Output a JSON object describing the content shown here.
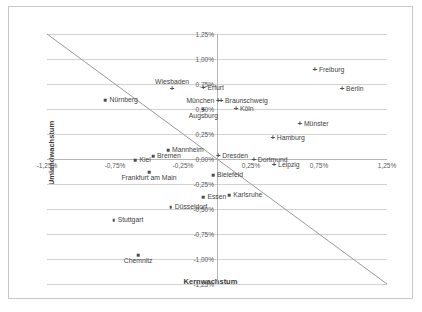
{
  "chart_data": {
    "type": "scatter",
    "title": "",
    "xlabel": "Kernwachstum",
    "ylabel": "Umlandwachstum",
    "xlim": [
      -1.25,
      1.25
    ],
    "ylim": [
      -1.25,
      1.25
    ],
    "grid": true,
    "legend": "none",
    "xticks": [
      "-1,25%",
      "-0,75%",
      "-0,25%",
      "0,25%",
      "0,75%",
      "1,25%"
    ],
    "xtick_values": [
      -1.25,
      -0.75,
      -0.25,
      0.25,
      0.75,
      1.25
    ],
    "yticks": [
      "-1,25%",
      "-1,00%",
      "-0,75%",
      "-0,50%",
      "-0,25%",
      "0,00%",
      "0,25%",
      "0,50%",
      "0,75%",
      "1,00%",
      "1,25%"
    ],
    "ytick_values": [
      -1.25,
      -1.0,
      -0.75,
      -0.5,
      -0.25,
      0.0,
      0.25,
      0.5,
      0.75,
      1.0,
      1.25
    ],
    "reference_line": {
      "name": "diagonal",
      "from": [
        -1.25,
        1.25
      ],
      "to": [
        1.25,
        -1.25
      ],
      "color": "#9a9a9a"
    },
    "points": [
      {
        "label": "Freiburg",
        "x": 0.72,
        "y": 0.89,
        "marker": "cross",
        "label_pos": "r"
      },
      {
        "label": "Berlin",
        "x": 0.92,
        "y": 0.7,
        "marker": "cross",
        "label_pos": "r"
      },
      {
        "label": "Wiesbaden",
        "x": -0.33,
        "y": 0.7,
        "marker": "cross",
        "label_pos": "above"
      },
      {
        "label": "Erfurt",
        "x": -0.1,
        "y": 0.71,
        "marker": "cross",
        "label_pos": "r"
      },
      {
        "label": "Nürnberg",
        "x": -0.82,
        "y": 0.59,
        "marker": "square",
        "label_pos": "r"
      },
      {
        "label": "Braunschweig",
        "x": 0.03,
        "y": 0.58,
        "marker": "cross",
        "label_pos": "r"
      },
      {
        "label": "München",
        "x": 0.01,
        "y": 0.58,
        "marker": "cross",
        "label_pos": "l"
      },
      {
        "label": "Köln",
        "x": 0.14,
        "y": 0.5,
        "marker": "cross",
        "label_pos": "r"
      },
      {
        "label": "Augsburg",
        "x": -0.1,
        "y": 0.49,
        "marker": "cross",
        "label_pos": "below"
      },
      {
        "label": "Münster",
        "x": 0.61,
        "y": 0.35,
        "marker": "cross",
        "label_pos": "r"
      },
      {
        "label": "Hamburg",
        "x": 0.41,
        "y": 0.21,
        "marker": "cross",
        "label_pos": "r"
      },
      {
        "label": "Mannheim",
        "x": -0.36,
        "y": 0.09,
        "marker": "square",
        "label_pos": "r"
      },
      {
        "label": "Dresden",
        "x": 0.01,
        "y": 0.03,
        "marker": "cross",
        "label_pos": "r"
      },
      {
        "label": "Bremen",
        "x": -0.47,
        "y": 0.03,
        "marker": "square",
        "label_pos": "r"
      },
      {
        "label": "Kiel",
        "x": -0.6,
        "y": -0.01,
        "marker": "square",
        "label_pos": "r"
      },
      {
        "label": "Dortmund",
        "x": 0.27,
        "y": -0.01,
        "marker": "cross",
        "label_pos": "r"
      },
      {
        "label": "Leipzig",
        "x": 0.42,
        "y": -0.06,
        "marker": "cross",
        "label_pos": "r"
      },
      {
        "label": "Frankfurt am Main",
        "x": -0.5,
        "y": -0.13,
        "marker": "square",
        "label_pos": "below"
      },
      {
        "label": "Bielefeld",
        "x": -0.03,
        "y": -0.16,
        "marker": "square",
        "label_pos": "r"
      },
      {
        "label": "Essen",
        "x": -0.1,
        "y": -0.38,
        "marker": "square",
        "label_pos": "r"
      },
      {
        "label": "Karlsruhe",
        "x": 0.09,
        "y": -0.36,
        "marker": "square",
        "label_pos": "r"
      },
      {
        "label": "Düsseldorf",
        "x": -0.34,
        "y": -0.48,
        "marker": "square",
        "label_pos": "r"
      },
      {
        "label": "Stuttgart",
        "x": -0.76,
        "y": -0.61,
        "marker": "square",
        "label_pos": "r"
      },
      {
        "label": "Chemnitz",
        "x": -0.58,
        "y": -0.96,
        "marker": "square",
        "label_pos": "below"
      }
    ]
  },
  "axes": {
    "x_title": "Kernwachstum",
    "y_title": "Umlandwachstum"
  }
}
